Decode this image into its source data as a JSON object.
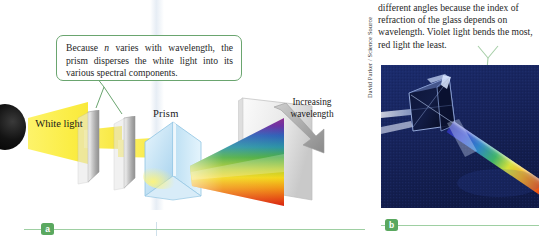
{
  "figure": {
    "panel_a": {
      "badge": "a",
      "callout": {
        "text_part1": "Because ",
        "text_italic": "n",
        "text_part2": " varies with wavelength, the prism disperses the white light into its various spectral components."
      },
      "labels": {
        "white_light": "White light",
        "prism": "Prism",
        "increasing_wavelength": "Increasing wavelength"
      },
      "icons": {
        "light_source": "light-source-sphere",
        "arrow": "increasing-wavelength-arrow"
      },
      "colors": {
        "beam": "#fbed4f",
        "prism_glass": "#cfe7f5",
        "callout_border": "#6aa56f",
        "badge": "#5aa85f",
        "rule": "#9ecfa2"
      },
      "spectrum_colors": [
        "#8e2f8e",
        "#5a33a8",
        "#2a5fb8",
        "#2e9a86",
        "#4fae42",
        "#c8d22a",
        "#f2d21c",
        "#ef8a18",
        "#e03412"
      ]
    },
    "panel_b": {
      "badge": "b",
      "body_text": "different angles because the index of refraction of the glass depends on wavelength. Violet light bends the most, red light the least.",
      "photo_credit": "David Parker / Science Source",
      "photo": {
        "name": "prism-dispersion-photograph",
        "background_color": "#16235c",
        "description": "glass prism on dark blue background dispersing a white beam into a rainbow spectrum"
      }
    }
  }
}
